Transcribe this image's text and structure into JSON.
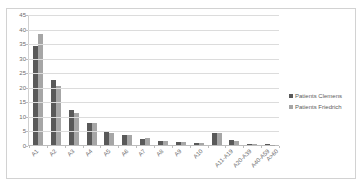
{
  "top_remnant_text": "",
  "chart_data": {
    "type": "bar",
    "title": "",
    "subtitle": "",
    "xlabel": "",
    "ylabel": "",
    "grid": true,
    "legend_position": "right",
    "ylim": [
      0,
      45
    ],
    "ytick_step": 5,
    "yticks": [
      "45",
      "40",
      "35",
      "30",
      "25",
      "20",
      "15",
      "10",
      "5",
      "0"
    ],
    "categories": [
      "A1",
      "A2",
      "A3",
      "A4",
      "A5",
      "A6",
      "A7",
      "A8",
      "A9",
      "A10",
      "A11-A19",
      "A20-A39",
      "A40-A59",
      "A>60"
    ],
    "series": [
      {
        "name": "Patients Clemens",
        "color": "#595959",
        "values": [
          34.0,
          22.3,
          12.2,
          7.4,
          4.7,
          3.3,
          2.2,
          1.5,
          1.2,
          0.8,
          4.2,
          1.8,
          0.3,
          0.3
        ]
      },
      {
        "name": "Patients Friedrich",
        "color": "#a6a6a6",
        "values": [
          38.2,
          20.2,
          11.0,
          7.4,
          4.2,
          3.3,
          2.5,
          1.5,
          1.2,
          0.8,
          4.2,
          1.4,
          0.2,
          0.1
        ]
      }
    ]
  },
  "legend": {
    "items": [
      {
        "label": "Patients Clemens",
        "swatch": "legend-swatch-clemens"
      },
      {
        "label": "Patients Friedrich",
        "swatch": "legend-swatch-friedrich"
      }
    ]
  },
  "colors": {
    "series_dark": "#595959",
    "series_light": "#a6a6a6",
    "gridline": "#dcdcdc",
    "axis": "#bdbdbd",
    "frame": "#d2d2d2",
    "text": "#6b6b6b"
  }
}
